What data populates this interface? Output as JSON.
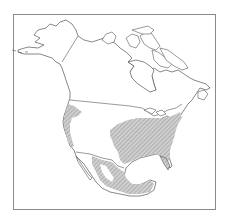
{
  "map": {
    "region": "North America",
    "layers": {
      "land_outline": "coastlines and national borders",
      "range": "hatched distribution range"
    },
    "colors": {
      "background": "#ffffff",
      "outline": "#555555",
      "border_frame": "#8a8a8a",
      "range_fill": "#bdbdbd",
      "range_hatch": "#8f8f8f"
    },
    "range_areas": [
      "eastern-united-states",
      "pacific-coast",
      "mexico"
    ]
  }
}
